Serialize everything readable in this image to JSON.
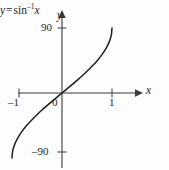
{
  "figure": {
    "background_color": "#fdfdfd",
    "ink_color": "#262626"
  },
  "labels": {
    "y_axis": "y",
    "x_axis": "x",
    "origin": "0",
    "x_tick_neg1": "–1",
    "x_tick_1": "1",
    "y_tick_90": "90",
    "y_tick_neg90": "–90",
    "equation_lhs": "y",
    "equation_equals": "=",
    "equation_fn": "sin",
    "equation_exponent": "–1",
    "equation_arg": "x",
    "equation_full": "y = sin–1 x"
  },
  "chart_data": {
    "type": "line",
    "title": "",
    "subtitle": "",
    "xlabel": "x",
    "ylabel": "y",
    "xlim": [
      -1.25,
      1.45
    ],
    "ylim": [
      -130,
      130
    ],
    "xticks": [
      -1,
      0,
      1
    ],
    "xticklabels": [
      "–1",
      "0",
      "1"
    ],
    "yticks": [
      -90,
      90
    ],
    "yticklabels": [
      "–90",
      "90"
    ],
    "grid": false,
    "legend": false,
    "annotations": [
      {
        "text": "y = sin–1 x",
        "x": 1.12,
        "y": 83
      }
    ],
    "series": [
      {
        "name": "y = sin^-1 x (degrees)",
        "x": [
          -1.0,
          -0.99,
          -0.97,
          -0.94,
          -0.9,
          -0.85,
          -0.8,
          -0.7,
          -0.6,
          -0.5,
          -0.4,
          -0.3,
          -0.2,
          -0.1,
          0.0,
          0.1,
          0.2,
          0.3,
          0.4,
          0.5,
          0.6,
          0.7,
          0.8,
          0.85,
          0.9,
          0.94,
          0.97,
          0.99,
          1.0
        ],
        "y": [
          -90.0,
          -81.9,
          -75.9,
          -70.1,
          -64.2,
          -58.2,
          -53.1,
          -44.4,
          -36.9,
          -30.0,
          -23.6,
          -17.5,
          -11.5,
          -5.7,
          0.0,
          5.7,
          11.5,
          17.5,
          23.6,
          30.0,
          36.9,
          44.4,
          53.1,
          58.2,
          64.2,
          70.1,
          75.9,
          81.9,
          90.0
        ]
      }
    ]
  }
}
